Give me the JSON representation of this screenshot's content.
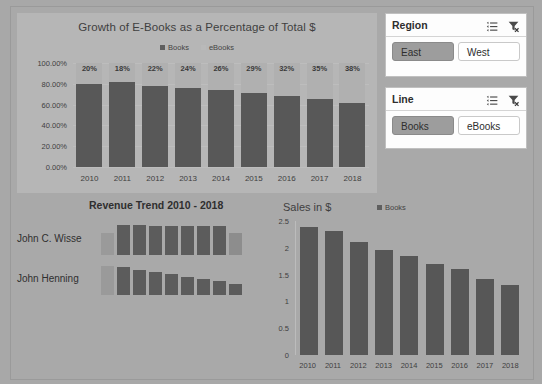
{
  "dashboard": {
    "background_color": "#a9a9a9"
  },
  "slicers": [
    {
      "id": "region",
      "title": "Region",
      "multiselect_icon": "multi-select-icon",
      "clear_filter_icon": "clear-filter-icon",
      "items": [
        {
          "label": "East",
          "selected": true
        },
        {
          "label": "West",
          "selected": false
        }
      ]
    },
    {
      "id": "line",
      "title": "Line",
      "multiselect_icon": "multi-select-icon",
      "clear_filter_icon": "clear-filter-icon",
      "items": [
        {
          "label": "Books",
          "selected": true
        },
        {
          "label": "eBooks",
          "selected": false
        }
      ]
    }
  ],
  "chart_data": [
    {
      "id": "growth-stacked-chart",
      "type": "bar",
      "stacked": true,
      "title": "Growth of E-Books as a Percentage of Total $",
      "xlabel": "",
      "ylabel": "",
      "categories": [
        "2010",
        "2011",
        "2012",
        "2013",
        "2014",
        "2015",
        "2016",
        "2017",
        "2018"
      ],
      "ytick_labels": [
        "100.00%",
        "80.00%",
        "60.00%",
        "40.00%",
        "20.00%",
        "0.00%"
      ],
      "ytick_values": [
        100,
        80,
        60,
        40,
        20,
        0
      ],
      "ylim": [
        0,
        100
      ],
      "grid": true,
      "legend": [
        "Books",
        "eBooks"
      ],
      "legend_position": "top",
      "series": [
        {
          "name": "Books",
          "values": [
            80,
            82,
            78,
            76,
            74,
            71,
            68,
            65,
            62
          ],
          "color": "#585858"
        },
        {
          "name": "eBooks",
          "values": [
            20,
            18,
            22,
            24,
            26,
            29,
            32,
            35,
            38
          ],
          "color": "#b0b0b0"
        }
      ],
      "data_labels": [
        "20%",
        "18%",
        "22%",
        "24%",
        "26%",
        "29%",
        "32%",
        "35%",
        "38%"
      ]
    },
    {
      "id": "revenue-trend-sparklines",
      "type": "bar",
      "title": "Revenue Trend 2010 - 2018",
      "xlabel": "",
      "ylabel": "",
      "grid": false,
      "categories": [
        "2010",
        "2011",
        "2012",
        "2013",
        "2014",
        "2015",
        "2016",
        "2017",
        "2018"
      ],
      "series": [
        {
          "name": "John C. Wisse",
          "values": [
            22,
            30,
            30,
            29,
            29,
            29,
            29,
            29,
            22
          ]
        },
        {
          "name": "John Henning",
          "values": [
            29,
            28,
            25,
            23,
            21,
            18,
            16,
            14,
            11
          ]
        }
      ]
    },
    {
      "id": "sales-chart",
      "type": "bar",
      "title": "Sales in $",
      "xlabel": "",
      "ylabel": "",
      "categories": [
        "2010",
        "2011",
        "2012",
        "2013",
        "2014",
        "2015",
        "2016",
        "2017",
        "2018"
      ],
      "ytick_labels": [
        "2.5",
        "2",
        "1.5",
        "1",
        "0.5",
        "0"
      ],
      "ytick_values": [
        2.5,
        2,
        1.5,
        1,
        0.5,
        0
      ],
      "ylim": [
        0,
        2.5
      ],
      "grid": false,
      "legend": [
        "Books"
      ],
      "legend_position": "top-right",
      "series": [
        {
          "name": "Books",
          "values": [
            2.38,
            2.31,
            2.11,
            1.95,
            1.85,
            1.69,
            1.6,
            1.42,
            1.31
          ],
          "color": "#575757"
        }
      ]
    }
  ]
}
